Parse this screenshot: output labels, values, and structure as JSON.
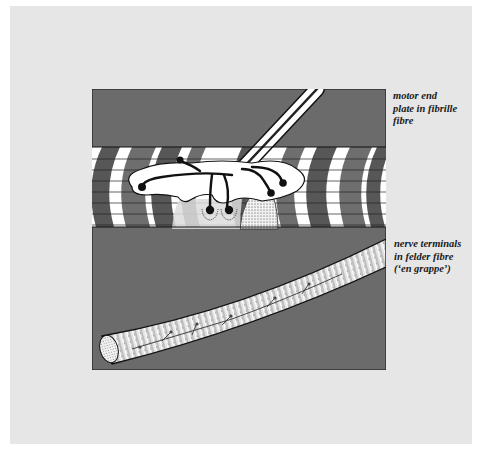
{
  "page": {
    "background_color": "#e6e6e6",
    "figure_background_color": "#6b6b6b"
  },
  "figure": {
    "top_panel": {
      "name": "motor end plate in fibrille fibre",
      "caption_lines": [
        "motor end",
        "plate in fibrille",
        "fibre"
      ]
    },
    "bottom_panel": {
      "name": "nerve terminals in felder fibre ('en grappe')",
      "caption_lines": [
        "nerve terminals",
        "in felder fibre",
        "(‘en grappe’)"
      ]
    }
  }
}
